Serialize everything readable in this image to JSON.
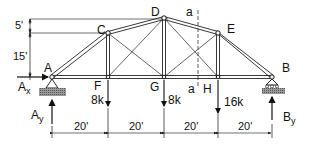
{
  "diagram": {
    "type": "truss",
    "nodes": {
      "A": {
        "label": "A"
      },
      "B": {
        "label": "B"
      },
      "C": {
        "label": "C"
      },
      "D": {
        "label": "D"
      },
      "E": {
        "label": "E"
      },
      "F": {
        "label": "F"
      },
      "G": {
        "label": "G"
      },
      "H": {
        "label": "H"
      }
    },
    "section": {
      "label_top": "a",
      "label_bottom": "a"
    },
    "loads": {
      "F": "8k",
      "G": "8k",
      "H": "16k"
    },
    "reactions": {
      "Ax": {
        "main": "A",
        "sub": "x"
      },
      "Ay": {
        "main": "A",
        "sub": "y"
      },
      "By": {
        "main": "B",
        "sub": "y"
      }
    },
    "vertical_dimensions": [
      "5'",
      "15'"
    ],
    "horizontal_dimensions": [
      "20'",
      "20'",
      "20'",
      "20'"
    ]
  }
}
